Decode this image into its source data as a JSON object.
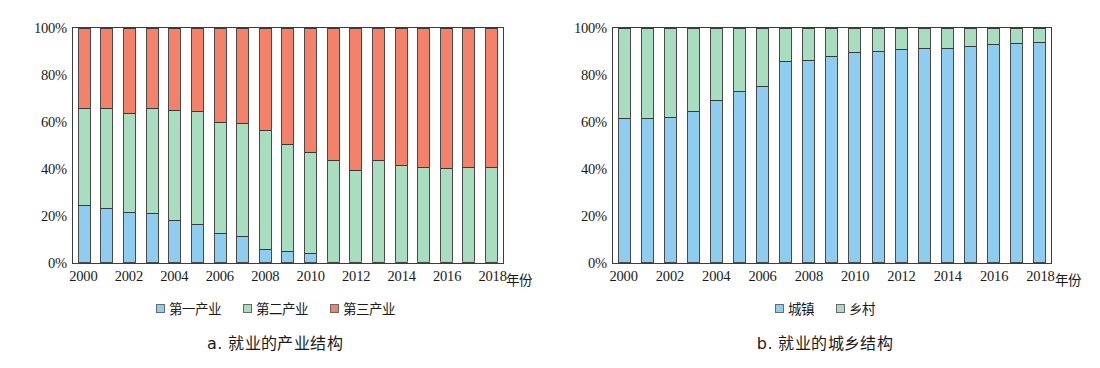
{
  "chart_data": [
    {
      "id": "a",
      "type": "bar",
      "stacked": true,
      "percent": true,
      "title": "a. 就业的产业结构",
      "caption": "a. 就业的产业结构",
      "xlabel": "年份",
      "ylabel": "",
      "ylim": [
        0,
        100
      ],
      "yticks": [
        "0%",
        "20%",
        "40%",
        "60%",
        "80%",
        "100%"
      ],
      "ytick_values": [
        0,
        20,
        40,
        60,
        80,
        100
      ],
      "grid": false,
      "legend_position": "bottom",
      "categories": [
        2000,
        2001,
        2002,
        2003,
        2004,
        2005,
        2006,
        2007,
        2008,
        2009,
        2010,
        2011,
        2012,
        2013,
        2014,
        2015,
        2016,
        2017,
        2018
      ],
      "xtick_labels": [
        "2000",
        "",
        "2002",
        "",
        "2004",
        "",
        "2006",
        "",
        "2008",
        "",
        "2010",
        "",
        "2012",
        "",
        "2014",
        "",
        "2016",
        "",
        "2018"
      ],
      "series": [
        {
          "name": "第一产业",
          "color": "#8ecdf0",
          "values": [
            24.7,
            23.5,
            21.8,
            21.2,
            18.3,
            16.6,
            12.6,
            11.7,
            6.0,
            5.2,
            4.4,
            0.5,
            0.4,
            0.4,
            0.3,
            0.3,
            0.3,
            0.3,
            0.3
          ]
        },
        {
          "name": "第二产业",
          "color": "#a9ddbf",
          "values": [
            41.3,
            42.6,
            42.2,
            44.8,
            47.0,
            47.9,
            47.6,
            47.8,
            50.6,
            45.3,
            43.0,
            43.0,
            38.9,
            43.3,
            41.1,
            40.3,
            40.0,
            40.2,
            40.2
          ]
        },
        {
          "name": "第三产业",
          "color": "#f4816a",
          "values": [
            34.0,
            33.9,
            36.0,
            34.0,
            34.7,
            35.5,
            39.8,
            40.5,
            43.4,
            49.5,
            52.6,
            56.5,
            60.7,
            56.3,
            58.6,
            59.4,
            59.7,
            59.5,
            59.5
          ]
        }
      ]
    },
    {
      "id": "b",
      "type": "bar",
      "stacked": true,
      "percent": true,
      "title": "b. 就业的城乡结构",
      "caption": "b. 就业的城乡结构",
      "xlabel": "年份",
      "ylabel": "",
      "ylim": [
        0,
        100
      ],
      "yticks": [
        "0%",
        "20%",
        "40%",
        "60%",
        "80%",
        "100%"
      ],
      "ytick_values": [
        0,
        20,
        40,
        60,
        80,
        100
      ],
      "grid": false,
      "legend_position": "bottom",
      "categories": [
        2000,
        2001,
        2002,
        2003,
        2004,
        2005,
        2006,
        2007,
        2008,
        2009,
        2010,
        2011,
        2012,
        2013,
        2014,
        2015,
        2016,
        2017,
        2018
      ],
      "xtick_labels": [
        "2000",
        "",
        "2002",
        "",
        "2004",
        "",
        "2006",
        "",
        "2008",
        "",
        "2010",
        "",
        "2012",
        "",
        "2014",
        "",
        "2016",
        "",
        "2018"
      ],
      "series": [
        {
          "name": "城镇",
          "color": "#8ecdf0",
          "values": [
            61.7,
            61.9,
            62.0,
            64.9,
            69.3,
            73.3,
            75.3,
            86.0,
            86.6,
            87.9,
            89.6,
            90.4,
            91.2,
            91.3,
            91.6,
            92.5,
            93.2,
            93.6,
            93.9
          ]
        },
        {
          "name": "乡村",
          "color": "#a9ddbf",
          "values": [
            38.3,
            38.1,
            38.0,
            35.1,
            30.7,
            26.7,
            24.7,
            14.0,
            13.4,
            12.1,
            10.4,
            9.6,
            8.8,
            8.7,
            8.4,
            7.5,
            6.8,
            6.4,
            6.1
          ]
        }
      ]
    }
  ],
  "panels": [
    {
      "key": "a",
      "caption": "a. 就业的产业结构",
      "axis_unit": "年份",
      "legend": [
        {
          "label": "第一产业",
          "color": "#8ecdf0"
        },
        {
          "label": "第二产业",
          "color": "#a9ddbf"
        },
        {
          "label": "第三产业",
          "color": "#f4816a"
        }
      ]
    },
    {
      "key": "b",
      "caption": "b. 就业的城乡结构",
      "axis_unit": "年份",
      "legend": [
        {
          "label": "城镇",
          "color": "#8ecdf0"
        },
        {
          "label": "乡村",
          "color": "#a9ddbf"
        }
      ]
    }
  ],
  "colors": {
    "primary_industry": "#8ecdf0",
    "secondary_industry": "#a9ddbf",
    "tertiary_industry": "#f4816a",
    "urban": "#8ecdf0",
    "rural": "#a9ddbf",
    "axis": "#3d3d3d",
    "background": "#ffffff"
  }
}
